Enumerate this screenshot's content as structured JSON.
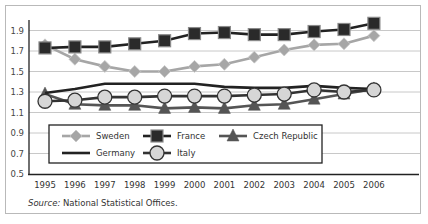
{
  "chart_data": {
    "type": "line",
    "title": "",
    "xlabel": "",
    "ylabel": "",
    "x": [
      "1995",
      "1996",
      "1997",
      "1998",
      "1999",
      "2000",
      "2001",
      "2002",
      "2003",
      "2004",
      "2005",
      "2006"
    ],
    "yticks": [
      "0.5",
      "0.7",
      "0.9",
      "1.1",
      "1.3",
      "1.5",
      "1.7",
      "1.9"
    ],
    "ylim": [
      0.5,
      2.0
    ],
    "grid": true,
    "legend_position": "inside-bottom-left",
    "series": [
      {
        "name": "Sweden",
        "marker": "diamond",
        "color": "#a6a6a6",
        "values": [
          1.76,
          1.62,
          1.55,
          1.5,
          1.5,
          1.55,
          1.57,
          1.64,
          1.71,
          1.76,
          1.77,
          1.85
        ]
      },
      {
        "name": "France",
        "marker": "square",
        "color": "#222222",
        "values": [
          1.73,
          1.74,
          1.74,
          1.77,
          1.8,
          1.87,
          1.88,
          1.86,
          1.86,
          1.89,
          1.91,
          1.97
        ]
      },
      {
        "name": "Czech Republic",
        "marker": "triangle",
        "color": "#555555",
        "values": [
          1.28,
          1.18,
          1.17,
          1.17,
          1.14,
          1.15,
          1.14,
          1.17,
          1.18,
          1.23,
          1.28,
          1.33
        ]
      },
      {
        "name": "Germany",
        "marker": "none",
        "color": "#222222",
        "values": [
          1.29,
          1.33,
          1.38,
          1.38,
          1.38,
          1.38,
          1.35,
          1.34,
          1.34,
          1.36,
          1.34,
          1.33
        ]
      },
      {
        "name": "Italy",
        "marker": "circle",
        "color": "#333333",
        "values": [
          1.21,
          1.22,
          1.25,
          1.25,
          1.26,
          1.26,
          1.26,
          1.27,
          1.28,
          1.32,
          1.3,
          1.32
        ]
      }
    ]
  },
  "legend": {
    "items": [
      "Sweden",
      "France",
      "Czech Republic",
      "Germany",
      "Italy"
    ]
  },
  "source": {
    "label": "Source:",
    "text": " National Statistical Offices."
  }
}
